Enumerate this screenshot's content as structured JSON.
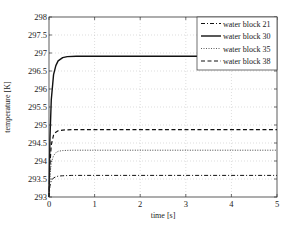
{
  "chart_data": {
    "type": "line",
    "title": "",
    "xlabel": "time [s]",
    "ylabel": "temperature [K]",
    "xlim": [
      0,
      5
    ],
    "ylim": [
      293,
      298
    ],
    "xticks": [
      0,
      1,
      2,
      3,
      4,
      5
    ],
    "yticks": [
      293,
      293.5,
      294,
      294.5,
      295,
      295.5,
      296,
      296.5,
      297,
      297.5,
      298
    ],
    "xtick_labels": [
      "0",
      "1",
      "2",
      "3",
      "4",
      "5"
    ],
    "ytick_labels": [
      "293",
      "293.5",
      "294",
      "294.5",
      "295",
      "295.5",
      "296",
      "296.5",
      "297",
      "297.5",
      "298"
    ],
    "grid": true,
    "legend_position": "upper right",
    "series": [
      {
        "name": "water block 21",
        "style": "dashdot",
        "x": [
          0,
          0.02,
          0.05,
          0.1,
          0.15,
          0.2,
          0.3,
          0.5,
          1,
          5
        ],
        "values": [
          293.0,
          293.3,
          293.45,
          293.53,
          293.56,
          293.58,
          293.59,
          293.6,
          293.6,
          293.6
        ]
      },
      {
        "name": "water block 30",
        "style": "solid",
        "x": [
          0,
          0.02,
          0.05,
          0.1,
          0.15,
          0.2,
          0.3,
          0.4,
          0.6,
          1,
          5
        ],
        "values": [
          293.0,
          294.6,
          295.7,
          296.4,
          296.65,
          296.78,
          296.87,
          296.9,
          296.91,
          296.91,
          296.91
        ]
      },
      {
        "name": "water block 35",
        "style": "dotted",
        "x": [
          0,
          0.02,
          0.05,
          0.1,
          0.15,
          0.2,
          0.3,
          0.5,
          1,
          5
        ],
        "values": [
          293.0,
          293.6,
          293.95,
          294.15,
          294.23,
          294.27,
          294.29,
          294.3,
          294.3,
          294.3
        ]
      },
      {
        "name": "water block 38",
        "style": "dashed",
        "x": [
          0,
          0.02,
          0.05,
          0.1,
          0.15,
          0.2,
          0.3,
          0.5,
          1,
          5
        ],
        "values": [
          293.0,
          293.9,
          294.45,
          294.72,
          294.8,
          294.84,
          294.86,
          294.87,
          294.87,
          294.87
        ]
      }
    ]
  }
}
